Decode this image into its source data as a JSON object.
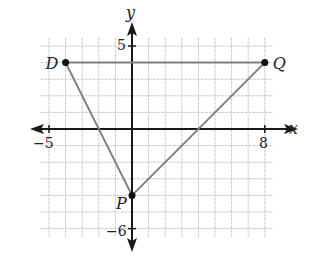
{
  "figure": {
    "type": "coordinate-plane",
    "axes": {
      "x_label": "x",
      "y_label": "y",
      "x_ticks_labeled": [
        {
          "value": -5,
          "label": "−5"
        },
        {
          "value": 8,
          "label": "8"
        }
      ],
      "y_ticks_labeled": [
        {
          "value": 5,
          "label": "5"
        },
        {
          "value": -6,
          "label": "−6"
        }
      ],
      "x_range": [
        -5,
        8
      ],
      "y_range": [
        -6,
        5
      ],
      "grid": true,
      "grid_step": 1
    },
    "points": [
      {
        "name": "D",
        "x": -4,
        "y": 4
      },
      {
        "name": "Q",
        "x": 8,
        "y": 4
      },
      {
        "name": "P",
        "x": 0,
        "y": -4
      }
    ],
    "segments": [
      {
        "from": "D",
        "to": "Q"
      },
      {
        "from": "D",
        "to": "P"
      },
      {
        "from": "P",
        "to": "Q"
      }
    ],
    "colors": {
      "axis": "#1a1a1a",
      "grid": "#c8c8c8",
      "segment": "#808080",
      "point": "#111111"
    }
  }
}
